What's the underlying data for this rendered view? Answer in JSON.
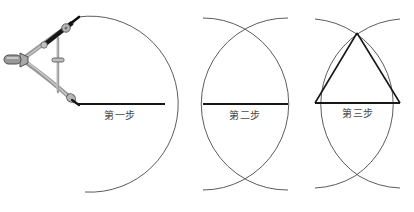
{
  "figure": {
    "background_color": "#ffffff",
    "line_color": "#4a4a4a",
    "segment_color": "#1a1a1a",
    "tool_color": "#8c8c8c",
    "tool_dark_color": "#1c1c1c",
    "width": 414,
    "height": 212
  },
  "panels": [
    {
      "id": "panel-1",
      "caption": "第一步",
      "caption_translation": "Step One",
      "description": "用圆规以线段左端为圆心、线段长为半径画弧",
      "segment": {
        "x1": 78,
        "y1": 104,
        "x2": 165,
        "y2": 104
      },
      "arcs": [
        {
          "name": "arc-left-center",
          "cx": 78,
          "cy": 104,
          "r": 88,
          "start_deg": -60,
          "end_deg": 85
        }
      ],
      "tool": {
        "name": "compass",
        "visible": true,
        "pivot": {
          "x": 22,
          "y": 59
        },
        "pencil_tip": {
          "x": 78,
          "y": 19
        },
        "needle_tip": {
          "x": 78,
          "y": 104
        }
      }
    },
    {
      "id": "panel-2",
      "caption": "第二步",
      "caption_translation": "Step Two",
      "description": "再以线段右端为圆心、同样半径画弧，两弧相交",
      "segment": {
        "x1": 203,
        "y1": 104,
        "x2": 288,
        "y2": 104
      },
      "arcs": [
        {
          "name": "arc-left-center",
          "cx": 203,
          "cy": 104,
          "r": 86,
          "start_deg": -62,
          "end_deg": 62
        },
        {
          "name": "arc-right-center",
          "cx": 288,
          "cy": 104,
          "r": 86,
          "start_deg": 118,
          "end_deg": 242
        }
      ],
      "intersections": [
        {
          "name": "upper-intersection",
          "x": 245,
          "y": 28
        },
        {
          "name": "lower-intersection",
          "x": 245,
          "y": 180
        }
      ],
      "tool": {
        "name": "compass",
        "visible": false
      }
    },
    {
      "id": "panel-3",
      "caption": "第三步",
      "caption_translation": "Step Three",
      "description": "连接交点与线段两端，得到等边三角形",
      "segment": {
        "x1": 315,
        "y1": 103,
        "x2": 400,
        "y2": 103
      },
      "arcs": [
        {
          "name": "arc-left-center",
          "cx": 315,
          "cy": 103,
          "r": 86,
          "start_deg": -62,
          "end_deg": 62
        },
        {
          "name": "arc-right-center",
          "cx": 400,
          "cy": 103,
          "r": 86,
          "start_deg": 118,
          "end_deg": 242
        }
      ],
      "intersections": [
        {
          "name": "upper-intersection",
          "x": 357,
          "y": 33
        },
        {
          "name": "lower-intersection",
          "x": 357,
          "y": 176
        }
      ],
      "triangle": {
        "name": "equilateral-triangle",
        "apex": {
          "x": 357,
          "y": 33
        },
        "left_vertex": {
          "x": 315,
          "y": 103
        },
        "right_vertex": {
          "x": 400,
          "y": 103
        }
      },
      "tool": {
        "name": "compass",
        "visible": false
      }
    }
  ]
}
